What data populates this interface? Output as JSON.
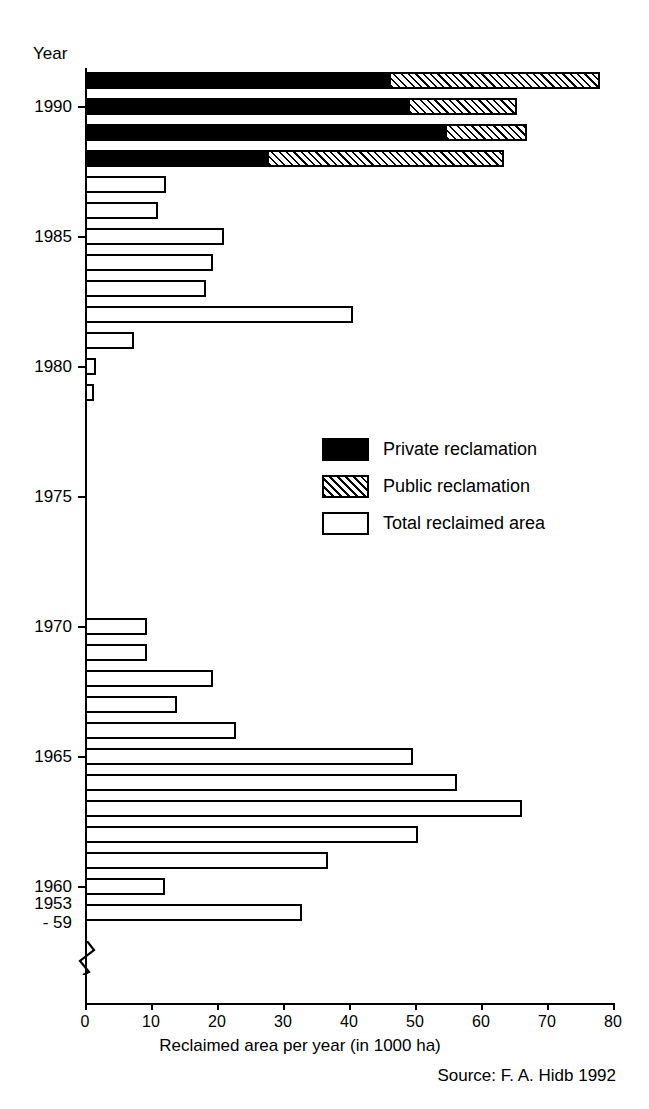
{
  "chart_data": {
    "type": "bar",
    "orientation": "horizontal",
    "title": "",
    "xlabel": "Reclaimed area per year (in 1000 ha)",
    "ylabel": "Year",
    "xlim": [
      0,
      80
    ],
    "xticks": [
      0,
      10,
      20,
      30,
      40,
      50,
      60,
      70,
      80
    ],
    "yticks": [
      "1953\n- 59",
      "1960",
      "1965",
      "1970",
      "1975",
      "1980",
      "1985",
      "1990"
    ],
    "grid": false,
    "legend_position": "center-right",
    "axis_break": true,
    "axis_break_note": "y-axis broken between 1953-59 group and 1960",
    "source": "Source: F. A. Hidb 1992",
    "legend": [
      {
        "name": "Private reclamation",
        "style": "solid-black"
      },
      {
        "name": "Public reclamation",
        "style": "diagonal-hatch"
      },
      {
        "name": "Total reclaimed area",
        "style": "white-outline"
      }
    ],
    "series": [
      {
        "name": "Total reclaimed area",
        "style": "white-outline"
      },
      {
        "name": "Private reclamation",
        "style": "solid-black"
      },
      {
        "name": "Public reclamation",
        "style": "diagonal-hatch"
      }
    ],
    "bars": [
      {
        "category": "1991",
        "total": 78.0,
        "private": 46.0,
        "public": 32.0,
        "split": true
      },
      {
        "category": "1990",
        "total": 65.5,
        "private": 49.0,
        "public": 16.5,
        "split": true
      },
      {
        "category": "1989",
        "total": 67.0,
        "private": 54.5,
        "public": 12.5,
        "split": true
      },
      {
        "category": "1988",
        "total": 63.5,
        "private": 27.5,
        "public": 36.0,
        "split": true
      },
      {
        "category": "1987",
        "total": 12.3,
        "split": false
      },
      {
        "category": "1986",
        "total": 11.0,
        "split": false
      },
      {
        "category": "1985",
        "total": 21.0,
        "split": false
      },
      {
        "category": "1984",
        "total": 19.4,
        "split": false
      },
      {
        "category": "1983",
        "total": 18.3,
        "split": false
      },
      {
        "category": "1982",
        "total": 40.6,
        "split": false
      },
      {
        "category": "1981",
        "total": 7.4,
        "split": false
      },
      {
        "category": "1980",
        "total": 1.6,
        "split": false
      },
      {
        "category": "1979",
        "total": 1.4,
        "split": false
      },
      {
        "category": "1978",
        "total": 0.0,
        "split": false
      },
      {
        "category": "1977",
        "total": 0.0,
        "split": false
      },
      {
        "category": "1976",
        "total": 0.0,
        "split": false
      },
      {
        "category": "1975",
        "total": 0.0,
        "split": false
      },
      {
        "category": "1974",
        "total": 0.0,
        "split": false
      },
      {
        "category": "1973",
        "total": 0.0,
        "split": false
      },
      {
        "category": "1972",
        "total": 0.0,
        "split": false
      },
      {
        "category": "1971",
        "total": 0.0,
        "split": false
      },
      {
        "category": "1970",
        "total": 9.4,
        "split": false
      },
      {
        "category": "1969",
        "total": 9.4,
        "split": false
      },
      {
        "category": "1968",
        "total": 19.4,
        "split": false
      },
      {
        "category": "1967",
        "total": 14.0,
        "split": false
      },
      {
        "category": "1966",
        "total": 22.9,
        "split": false
      },
      {
        "category": "1965",
        "total": 49.7,
        "split": false
      },
      {
        "category": "1964",
        "total": 56.4,
        "split": false
      },
      {
        "category": "1963",
        "total": 66.2,
        "split": false
      },
      {
        "category": "1962",
        "total": 50.5,
        "split": false
      },
      {
        "category": "1961",
        "total": 36.8,
        "split": false
      },
      {
        "category": "1960",
        "total": 12.1,
        "split": false
      },
      {
        "category": "1953-59",
        "total": 32.9,
        "split": false
      }
    ]
  },
  "axis": {
    "year_caption": "Year",
    "x_title": "Reclaimed area per year (in 1000 ha)",
    "x_tick_labels": [
      "0",
      "10",
      "20",
      "30",
      "40",
      "50",
      "60",
      "70",
      "80"
    ],
    "y_tick_labels": [
      "1990",
      "1985",
      "1980",
      "1975",
      "1970",
      "1965",
      "1960"
    ],
    "y_break_label_line1": "1953",
    "y_break_label_line2": "- 59"
  },
  "legend": {
    "items": [
      {
        "label": "Private reclamation"
      },
      {
        "label": "Public reclamation"
      },
      {
        "label": "Total reclaimed area"
      }
    ]
  },
  "footer": {
    "source": "Source: F. A. Hidb 1992"
  },
  "colors": {
    "ink": "#000000",
    "paper": "#ffffff"
  }
}
